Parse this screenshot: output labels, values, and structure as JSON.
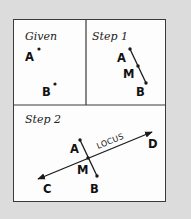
{
  "panels": {
    "given": {
      "title": "Given",
      "points": {
        "A": "A",
        "B": "B"
      }
    },
    "step1": {
      "title": "Step 1",
      "points": {
        "A": "A",
        "M": "M",
        "B": "B"
      }
    },
    "step2": {
      "title": "Step 2",
      "points": {
        "A": "A",
        "M": "M",
        "B": "B",
        "C": "C",
        "D": "D"
      },
      "line_label": "LOCUS"
    }
  },
  "colors": {
    "background": "#dcdcdc",
    "panel": "#fdfdfd",
    "ink": "#1a1a1a"
  }
}
